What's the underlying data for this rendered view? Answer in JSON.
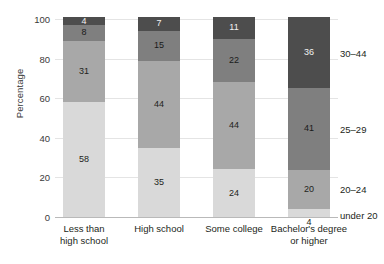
{
  "chart_data": {
    "type": "bar",
    "subtype": "stacked-bar-100",
    "title": "",
    "xlabel": "",
    "ylabel": "Percentage",
    "ylim": [
      0,
      100
    ],
    "yticks": [
      0,
      20,
      40,
      60,
      80,
      100
    ],
    "grid": true,
    "legend_position": "right",
    "categories": [
      "Less than high school",
      "High school",
      "Some college",
      "Bachelor's degree or higher"
    ],
    "category_lines": [
      [
        "Less than",
        "high school"
      ],
      [
        "High school"
      ],
      [
        "Some college"
      ],
      [
        "Bachelor's degree",
        "or higher"
      ]
    ],
    "series": [
      {
        "name": "under 20",
        "values": [
          58,
          35,
          24,
          4
        ],
        "color": "#d9d9d9"
      },
      {
        "name": "20-24",
        "values": [
          31,
          44,
          44,
          20
        ],
        "color": "#a8a8a8"
      },
      {
        "name": "25-29",
        "values": [
          8,
          15,
          22,
          41
        ],
        "color": "#7f7f7f"
      },
      {
        "name": "30-44",
        "values": [
          4,
          7,
          11,
          36
        ],
        "color": "#4d4d4d"
      }
    ],
    "series_labels_right": [
      "under 20",
      "20–24",
      "25–29",
      "30–44"
    ]
  },
  "axis": {
    "y_title": "Percentage",
    "y_tick_labels": [
      "0",
      "20",
      "40",
      "60",
      "80",
      "100"
    ]
  },
  "bars": [
    {
      "category": "Less than high school",
      "segments": [
        {
          "series": "under 20",
          "value": 58,
          "label": "58",
          "color": "#d9d9d9",
          "label_inside": true
        },
        {
          "series": "20-24",
          "value": 31,
          "label": "31",
          "color": "#a8a8a8",
          "label_inside": true
        },
        {
          "series": "25-29",
          "value": 8,
          "label": "8",
          "color": "#7f7f7f",
          "label_inside": true
        },
        {
          "series": "30-44",
          "value": 4,
          "label": "4",
          "color": "#4d4d4d",
          "label_inside": true
        }
      ]
    },
    {
      "category": "High school",
      "segments": [
        {
          "series": "under 20",
          "value": 35,
          "label": "35",
          "color": "#d9d9d9",
          "label_inside": true
        },
        {
          "series": "20-24",
          "value": 44,
          "label": "44",
          "color": "#a8a8a8",
          "label_inside": true
        },
        {
          "series": "25-29",
          "value": 15,
          "label": "15",
          "color": "#7f7f7f",
          "label_inside": true
        },
        {
          "series": "30-44",
          "value": 7,
          "label": "7",
          "color": "#4d4d4d",
          "label_inside": true
        }
      ]
    },
    {
      "category": "Some college",
      "segments": [
        {
          "series": "under 20",
          "value": 24,
          "label": "24",
          "color": "#d9d9d9",
          "label_inside": true
        },
        {
          "series": "20-24",
          "value": 44,
          "label": "44",
          "color": "#a8a8a8",
          "label_inside": true
        },
        {
          "series": "25-29",
          "value": 22,
          "label": "22",
          "color": "#7f7f7f",
          "label_inside": true
        },
        {
          "series": "30-44",
          "value": 11,
          "label": "11",
          "color": "#4d4d4d",
          "label_inside": true
        }
      ]
    },
    {
      "category": "Bachelor's degree or higher",
      "segments": [
        {
          "series": "under 20",
          "value": 4,
          "label": "4",
          "color": "#d9d9d9",
          "label_inside": false
        },
        {
          "series": "20-24",
          "value": 20,
          "label": "20",
          "color": "#a8a8a8",
          "label_inside": true
        },
        {
          "series": "25-29",
          "value": 41,
          "label": "41",
          "color": "#7f7f7f",
          "label_inside": true
        },
        {
          "series": "30-44",
          "value": 36,
          "label": "36",
          "color": "#4d4d4d",
          "label_inside": true
        }
      ]
    }
  ],
  "colors": {
    "under_20": "#d9d9d9",
    "age_20_24": "#a8a8a8",
    "age_25_29": "#7f7f7f",
    "age_30_44": "#4d4d4d",
    "gridline": "#e4e4e4",
    "axis": "#b9b9b9",
    "text": "#231f20",
    "background": "#ffffff"
  }
}
